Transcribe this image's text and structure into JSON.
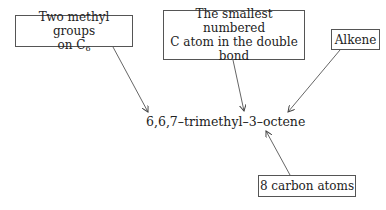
{
  "diagram": {
    "center_label": "6,6,7–trimethyl–3–octene",
    "annotations": [
      {
        "id": "methyl",
        "lines": [
          "Two methyl groups",
          "on C"
        ],
        "subscript": "6"
      },
      {
        "id": "double-bond",
        "lines": [
          "The smallest numbered",
          "C atom in the double",
          "bond"
        ]
      },
      {
        "id": "alkene",
        "lines": [
          "Alkene"
        ]
      },
      {
        "id": "carbons",
        "lines": [
          "8 carbon atoms"
        ]
      }
    ],
    "colors": {
      "line": "#555555",
      "text": "#222222",
      "background": "#ffffff"
    }
  }
}
